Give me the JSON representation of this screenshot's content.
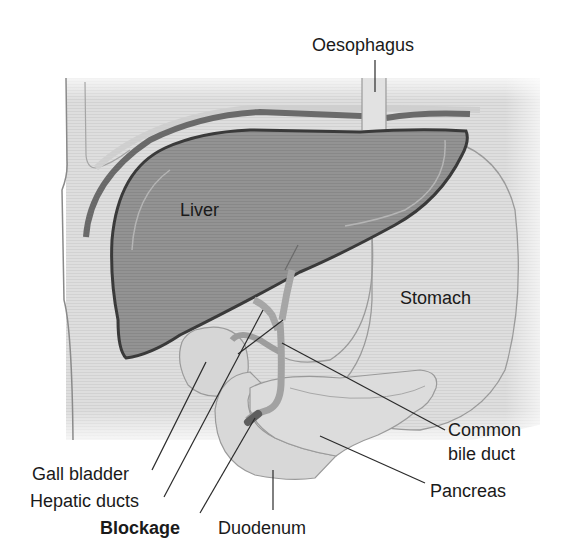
{
  "figure": {
    "colors": {
      "background": "#ffffff",
      "tissue": "#dcdcdc",
      "tissue_light": "#e6e6e6",
      "liver_fill": "#8e8e8e",
      "liver_outline": "#3a3a3a",
      "diaphragm_band": "#6a6a6a",
      "organ_outline": "#9a9a9a",
      "duct_fill": "#a6a6a6",
      "blockage_fill": "#6e6e6e",
      "leader_line": "#2a2a2a",
      "text": "#1a1a1a"
    }
  },
  "labels": {
    "oesophagus": "Oesophagus",
    "liver": "Liver",
    "stomach": "Stomach",
    "common_bile_duct": "Common\nbile duct",
    "gall_bladder": "Gall bladder",
    "hepatic_ducts": "Hepatic ducts",
    "pancreas": "Pancreas",
    "blockage": "Blockage",
    "duodenum": "Duodenum"
  }
}
